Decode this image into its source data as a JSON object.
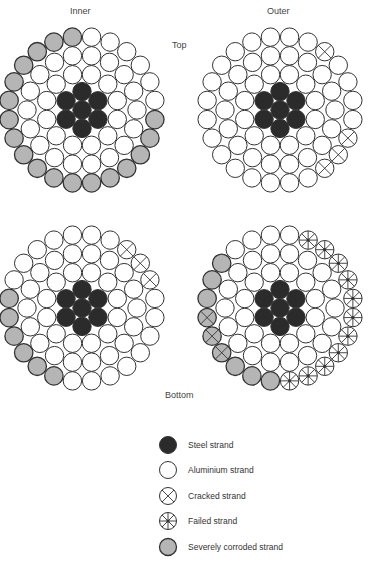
{
  "labels": {
    "inner": "Inner",
    "outer": "Outer",
    "top": "Top",
    "bottom": "Bottom"
  },
  "colors": {
    "steel": "#2b2b2b",
    "aluminium": "#ffffff",
    "corroded": "#b5b5b5",
    "stroke": "#333333"
  },
  "conductors": [
    {
      "id": "inner-top",
      "cx": 82,
      "cy": 110,
      "outer_ring": [
        "A",
        "A",
        "A",
        "A",
        "A",
        "A",
        "C",
        "C",
        "C",
        "C",
        "C",
        "C",
        "C",
        "C",
        "C",
        "C",
        "C",
        "C",
        "C",
        "C",
        "C",
        "C",
        "C",
        "C"
      ],
      "middle_ring": "all-aluminium",
      "inner_ring": "all-aluminium",
      "core": "steel"
    },
    {
      "id": "outer-top",
      "cx": 280,
      "cy": 110,
      "outer_ring": [
        "A",
        "A",
        "K",
        "A",
        "A",
        "A",
        "A",
        "K",
        "K",
        "K",
        "A",
        "A",
        "A",
        "A",
        "A",
        "A",
        "A",
        "A",
        "A",
        "A",
        "A",
        "A",
        "A",
        "A"
      ],
      "middle_ring": "all-aluminium",
      "inner_ring": "all-aluminium",
      "core": "steel"
    },
    {
      "id": "inner-bottom",
      "cx": 82,
      "cy": 308,
      "outer_ring": [
        "A",
        "A",
        "K",
        "K",
        "K",
        "A",
        "A",
        "A",
        "A",
        "A",
        "A",
        "A",
        "A",
        "C",
        "C",
        "C",
        "C",
        "C",
        "C",
        "A",
        "A",
        "A",
        "A",
        "A"
      ],
      "middle_ring": "all-aluminium",
      "inner_ring": "all-aluminium",
      "core": "steel"
    },
    {
      "id": "outer-bottom",
      "cx": 280,
      "cy": 308,
      "outer_ring": [
        "A",
        "F",
        "F",
        "F",
        "F",
        "F",
        "F",
        "F",
        "F",
        "F",
        "F",
        "F",
        "C",
        "C",
        "C",
        "X",
        "X",
        "X",
        "C",
        "C",
        "C",
        "A",
        "A",
        "A"
      ],
      "middle_ring": "all-aluminium",
      "inner_ring": "all-aluminium",
      "core": "steel"
    }
  ],
  "legend": {
    "items": [
      {
        "type": "steel",
        "label": "Steel strand"
      },
      {
        "type": "aluminium",
        "label": "Aluminium strand"
      },
      {
        "type": "cracked",
        "label": "Cracked strand"
      },
      {
        "type": "failed",
        "label": "Failed strand"
      },
      {
        "type": "corroded",
        "label": "Severely corroded strand"
      }
    ]
  }
}
